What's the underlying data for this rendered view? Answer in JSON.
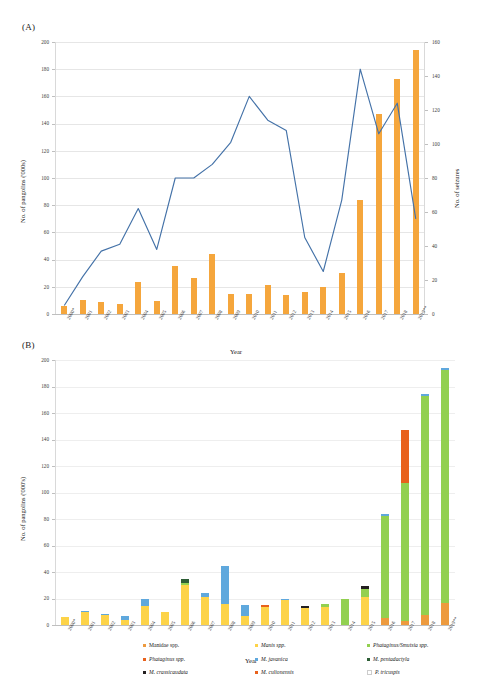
{
  "figure": {
    "panel_a_label": "(A)",
    "panel_b_label": "(B)"
  },
  "chart_data": [
    {
      "id": "panel_a",
      "type": "bar",
      "title": "(A)",
      "xlabel": "Year",
      "ylabel": "No. of pangolins ('000s)",
      "y2label": "No. of seizures",
      "ylim": [
        0,
        200
      ],
      "y2lim": [
        0,
        160
      ],
      "yticks": [
        0,
        20,
        40,
        60,
        80,
        100,
        120,
        140,
        160,
        180,
        200
      ],
      "y2ticks": [
        0,
        20,
        40,
        60,
        80,
        100,
        120,
        140,
        160
      ],
      "grid": true,
      "categories": [
        "2000*",
        "2001",
        "2002",
        "2003",
        "2004",
        "2005",
        "2006",
        "2007",
        "2008",
        "2009",
        "2010",
        "2011",
        "2012",
        "2013",
        "2014",
        "2015",
        "2016",
        "2017",
        "2018",
        "2019**"
      ],
      "series": [
        {
          "name": "No. of pangolins ('000s)",
          "kind": "bar",
          "axis": "left",
          "color": "#f5a63c",
          "values": [
            6,
            10.5,
            8.5,
            7.5,
            23.5,
            9.5,
            35,
            26.5,
            44,
            15,
            15,
            21,
            14,
            16,
            20,
            30.5,
            83.5,
            147,
            173,
            194
          ]
        },
        {
          "name": "No. of seizures",
          "kind": "line",
          "axis": "right",
          "color": "#4472a8",
          "values": [
            5,
            22,
            37,
            41,
            62,
            38,
            80,
            80,
            88,
            101,
            128,
            114,
            108,
            45,
            25,
            67,
            144,
            106,
            124,
            56
          ]
        }
      ]
    },
    {
      "id": "panel_b",
      "type": "bar",
      "stacked": true,
      "title": "(B)",
      "xlabel": "Year",
      "ylabel": "No. of pangolins ('000's)",
      "ylim": [
        0,
        200
      ],
      "yticks": [
        0,
        20,
        40,
        60,
        80,
        100,
        120,
        140,
        160,
        180,
        200
      ],
      "grid": true,
      "legend_position": "bottom",
      "categories": [
        "2000*",
        "2001",
        "2002",
        "2003",
        "2004",
        "2005",
        "2006",
        "2007",
        "2008",
        "2009",
        "2010",
        "2011",
        "2012",
        "2013",
        "2014",
        "2015",
        "2016",
        "2017",
        "2018",
        "2019**"
      ],
      "series": [
        {
          "name": "Manidae spp.",
          "italic": false,
          "color": "#ed9a3e",
          "values": [
            0,
            0,
            0,
            0,
            0,
            0,
            0,
            0,
            0,
            0,
            0,
            0,
            0,
            0,
            0,
            0,
            5,
            3,
            7.5,
            16.5
          ]
        },
        {
          "name": "Manis spp.",
          "italic": true,
          "color": "#fdd348",
          "values": [
            6,
            9.5,
            8,
            4,
            14,
            9.5,
            30,
            21,
            16,
            6.5,
            13.5,
            18.5,
            13,
            13.5,
            0,
            21,
            0,
            0,
            0,
            0
          ]
        },
        {
          "name": "Phataginus/Smutsia spp.",
          "italic": true,
          "color": "#92d050",
          "values": [
            0,
            0,
            0,
            0,
            0,
            0,
            2,
            0,
            0,
            0,
            0,
            0,
            0,
            2.5,
            19.5,
            6,
            77,
            104,
            165,
            176
          ]
        },
        {
          "name": "Phataginus spp.",
          "italic": true,
          "color": "#e8611c",
          "values": [
            0,
            0,
            0,
            0,
            0,
            0,
            0,
            0,
            0,
            0,
            1.5,
            0,
            0,
            0,
            0,
            0,
            0,
            40,
            0,
            0
          ]
        },
        {
          "name": "M. javanica",
          "italic": true,
          "color": "#5fa8dd",
          "values": [
            0,
            1,
            0.5,
            3,
            5.5,
            0,
            0,
            3,
            28.5,
            8.5,
            0,
            1.5,
            0,
            0,
            0,
            0,
            1.5,
            0,
            1.5,
            1.5
          ]
        },
        {
          "name": "M. pentadactyla",
          "italic": true,
          "color": "#2e5e36",
          "values": [
            0,
            0,
            0,
            0,
            0,
            0,
            3,
            0,
            0,
            0,
            0,
            0,
            0,
            0,
            0,
            0,
            0,
            0,
            0,
            0
          ]
        },
        {
          "name": "M. crassicaudata",
          "italic": true,
          "color": "#231f20",
          "values": [
            0,
            0,
            0,
            0,
            0,
            0,
            0,
            0,
            0,
            0,
            0,
            0,
            1,
            0,
            0,
            2.5,
            0,
            0,
            0,
            0
          ]
        },
        {
          "name": "M. culionensis",
          "italic": true,
          "color": "#e8611c",
          "values": [
            0,
            0,
            0,
            0,
            0,
            0,
            0,
            0,
            0,
            0,
            0,
            0,
            0,
            0,
            0,
            0,
            0,
            0,
            0,
            0
          ]
        },
        {
          "name": "P. tricuspis",
          "italic": true,
          "color": "#ffffff",
          "values": [
            0,
            0,
            0,
            0,
            0,
            0,
            0,
            0,
            0,
            0,
            0,
            0,
            0,
            0,
            0,
            0,
            0,
            0,
            0,
            0
          ]
        }
      ]
    }
  ]
}
